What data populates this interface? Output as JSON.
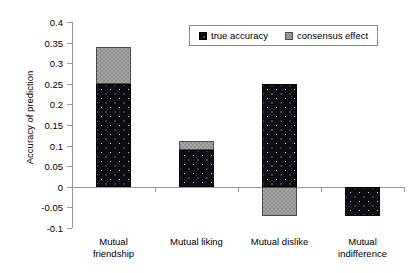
{
  "chart_data": {
    "type": "bar",
    "stacked": true,
    "title": "",
    "xlabel": "",
    "ylabel": "Accuracy of prediction",
    "categories": [
      "Mutual friendship",
      "Mutual liking",
      "Mutual dislike",
      "Mutual indifference"
    ],
    "category_lines": [
      [
        "Mutual",
        "friendship"
      ],
      [
        "Mutual liking",
        ""
      ],
      [
        "Mutual dislike",
        ""
      ],
      [
        "Mutual",
        "indifference"
      ]
    ],
    "series": [
      {
        "name": "true accuracy",
        "values": [
          0.25,
          0.09,
          0.25,
          -0.07
        ],
        "color": "#0d0d12"
      },
      {
        "name": "consensus effect",
        "values": [
          0.09,
          0.02,
          -0.07,
          0.0
        ],
        "color": "#a8a8a8"
      }
    ],
    "bar_totals": [
      0.34,
      0.11,
      0.25,
      -0.07
    ],
    "ylim": [
      -0.1,
      0.4
    ],
    "ytick_step": 0.05,
    "ytick_labels": [
      "0.4",
      "0.35",
      "0.3",
      "0.25",
      "0.2",
      "0.15",
      "0.1",
      "0.05",
      "0",
      "-0.05",
      "-0.1"
    ],
    "ytick_values": [
      0.4,
      0.35,
      0.3,
      0.25,
      0.2,
      0.15,
      0.1,
      0.05,
      0,
      -0.05,
      -0.1
    ],
    "grid": false,
    "legend_position": "top-center",
    "legend_entries": [
      "true accuracy",
      "consensus effect"
    ]
  }
}
